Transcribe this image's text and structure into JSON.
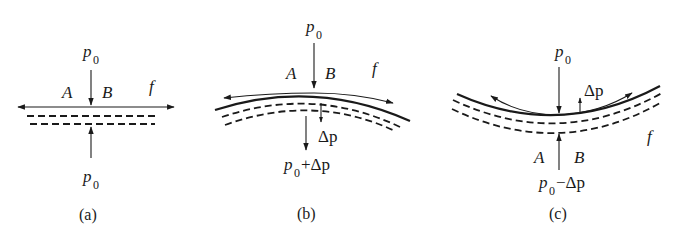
{
  "figure": {
    "panels": [
      {
        "id": "a",
        "caption": "(a)",
        "shape": "flat",
        "top_load": {
          "symbol": "p",
          "subscript": "0"
        },
        "bottom_load": {
          "symbol": "p",
          "subscript": "0"
        },
        "point_left": "A",
        "point_right": "B",
        "friction": "f"
      },
      {
        "id": "b",
        "caption": "(b)",
        "shape": "convex",
        "top_load": {
          "symbol": "p",
          "subscript": "0"
        },
        "delta_load": {
          "symbol": "Δp"
        },
        "bottom_load": {
          "symbol": "p",
          "subscript": "0",
          "suffix": "+Δp"
        },
        "point_left": "A",
        "point_right": "B",
        "friction": "f"
      },
      {
        "id": "c",
        "caption": "(c)",
        "shape": "concave",
        "top_load": {
          "symbol": "p",
          "subscript": "0"
        },
        "delta_load": {
          "symbol": "Δp"
        },
        "bottom_load": {
          "symbol": "p",
          "subscript": "0",
          "suffix": "−Δp"
        },
        "point_left": "A",
        "point_right": "B",
        "friction": "f"
      }
    ]
  }
}
